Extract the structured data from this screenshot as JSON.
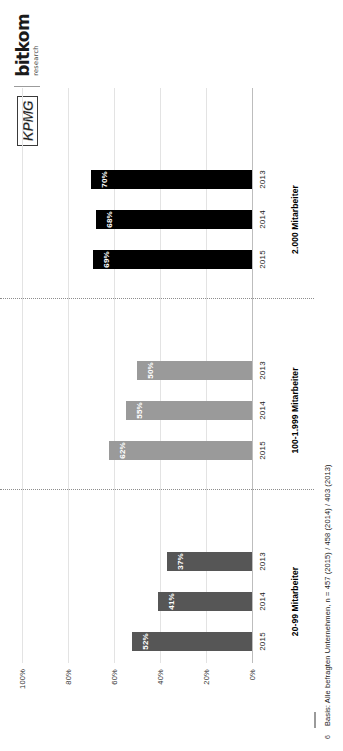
{
  "slide": {
    "page_number": "6",
    "footnote": "Basis: Alle befragten Unternehmen, n = 457 (2015) / 458 (2014) / 403 (2013)"
  },
  "logos": {
    "kpmg": "KPMG",
    "bitkom_main": "bitkom",
    "bitkom_sub": "research"
  },
  "chart_data": {
    "type": "bar",
    "title": "",
    "xlabel": "",
    "ylabel": "",
    "ylim": [
      0,
      100
    ],
    "grid": true,
    "legend": "none",
    "tick_labels": [
      "0%",
      "20%",
      "40%",
      "60%",
      "80%",
      "100%"
    ],
    "tick_values": [
      0,
      20,
      40,
      60,
      80,
      100
    ],
    "groups": [
      {
        "label": "20-99 Mitarbeiter",
        "color": "#565656",
        "categories": [
          "2015",
          "2014",
          "2013"
        ],
        "values": [
          52,
          41,
          37
        ],
        "value_labels": [
          "52%",
          "41%",
          "37%"
        ]
      },
      {
        "label": "100-1.999 Mitarbeiter",
        "color": "#9a9a9a",
        "categories": [
          "2015",
          "2014",
          "2013"
        ],
        "values": [
          62,
          55,
          50
        ],
        "value_labels": [
          "62%",
          "55%",
          "50%"
        ]
      },
      {
        "label": "2.000 Mitarbeiter",
        "color": "#000000",
        "categories": [
          "2015",
          "2014",
          "2013"
        ],
        "values": [
          69,
          68,
          70
        ],
        "value_labels": [
          "69%",
          "68%",
          "70%"
        ]
      }
    ]
  }
}
